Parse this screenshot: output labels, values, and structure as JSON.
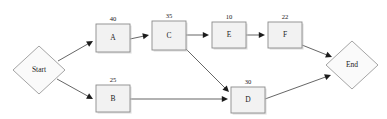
{
  "diagram": {
    "type": "activity-network-diagram",
    "background_color": "#ffffff",
    "node_fill": "#f2f2f2",
    "node_stroke": "#8c8c8c",
    "edge_color": "#4a4a4a",
    "terminals": [
      {
        "id": "start",
        "label": "Start",
        "shape": "diamond",
        "cx": 39,
        "cy": 70,
        "rx": 26,
        "ry": 24
      },
      {
        "id": "end",
        "label": "End",
        "shape": "diamond",
        "cx": 352,
        "cy": 65,
        "rx": 26,
        "ry": 24
      }
    ],
    "tasks": [
      {
        "id": "A",
        "label": "A",
        "weight": "40",
        "x": 96,
        "y": 24,
        "w": 34,
        "h": 28
      },
      {
        "id": "B",
        "label": "B",
        "weight": "25",
        "x": 96,
        "y": 85,
        "w": 34,
        "h": 27
      },
      {
        "id": "C",
        "label": "C",
        "weight": "35",
        "x": 152,
        "y": 21,
        "w": 34,
        "h": 29
      },
      {
        "id": "D",
        "label": "D",
        "weight": "30",
        "x": 231,
        "y": 87,
        "w": 34,
        "h": 26
      },
      {
        "id": "E",
        "label": "E",
        "weight": "10",
        "x": 212,
        "y": 22,
        "w": 34,
        "h": 26
      },
      {
        "id": "F",
        "label": "F",
        "weight": "22",
        "x": 268,
        "y": 22,
        "w": 34,
        "h": 26
      }
    ],
    "edges": [
      {
        "id": "start-a",
        "from": "Start",
        "to": "A",
        "x1": 58,
        "y1": 61,
        "x2": 93,
        "y2": 41
      },
      {
        "id": "start-b",
        "from": "Start",
        "to": "B",
        "x1": 57,
        "y1": 79,
        "x2": 93,
        "y2": 99
      },
      {
        "id": "a-c",
        "from": "A",
        "to": "C",
        "x1": 130,
        "y1": 39,
        "x2": 149,
        "y2": 35
      },
      {
        "id": "c-e",
        "from": "C",
        "to": "E",
        "x1": 186,
        "y1": 35,
        "x2": 209,
        "y2": 35
      },
      {
        "id": "e-f",
        "from": "E",
        "to": "F",
        "x1": 246,
        "y1": 35,
        "x2": 265,
        "y2": 35
      },
      {
        "id": "c-d",
        "from": "C",
        "to": "D",
        "x1": 184,
        "y1": 47,
        "x2": 229,
        "y2": 92
      },
      {
        "id": "b-d",
        "from": "B",
        "to": "D",
        "x1": 130,
        "y1": 99,
        "x2": 228,
        "y2": 99
      },
      {
        "id": "f-end",
        "from": "F",
        "to": "End",
        "x1": 302,
        "y1": 45,
        "x2": 332,
        "y2": 57
      },
      {
        "id": "d-end",
        "from": "D",
        "to": "End",
        "x1": 265,
        "y1": 99,
        "x2": 331,
        "y2": 75
      }
    ]
  }
}
